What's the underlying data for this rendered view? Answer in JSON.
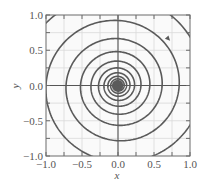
{
  "chart_data": {
    "type": "line",
    "title": "",
    "xlabel": "x",
    "ylabel": "y",
    "xlim": [
      -1.0,
      1.0
    ],
    "ylim": [
      -1.0,
      1.0
    ],
    "xticks": [
      -1.0,
      -0.5,
      0.0,
      0.5,
      1.0
    ],
    "yticks": [
      -1.0,
      -0.5,
      0.0,
      0.5,
      1.0
    ],
    "xtick_labels": [
      "−1.0",
      "−0.5",
      "0.0",
      "0.5",
      "1.0"
    ],
    "ytick_labels": [
      "−1.0",
      "−0.5",
      "0.0",
      "0.5",
      "1.0"
    ],
    "minor_tick_step": 0.25,
    "grid": true,
    "grid_step": 0.25,
    "zero_axes": true,
    "legend": null,
    "series": [
      {
        "name": "phase trajectory (spiral sink)",
        "kind": "logarithmic spiral, clockwise, decaying to origin",
        "start_angle_deg": 150,
        "start_radius": 1.35,
        "decay_per_radian": 0.052,
        "turns": 14,
        "direction": "clockwise",
        "arrow_at": [
          0.7,
          0.66
        ],
        "sample_axis_crossings": {
          "positive_x": [
            0.97,
            0.74,
            0.53,
            0.36,
            0.26,
            0.18,
            0.11,
            0.06
          ],
          "positive_y": [
            0.87,
            0.65,
            0.5,
            0.37,
            0.28,
            0.21
          ],
          "negative_x": [
            -0.85,
            -0.61,
            -0.43,
            -0.31,
            -0.21,
            -0.14
          ],
          "negative_y": [
            -0.91,
            -0.67,
            -0.48,
            -0.34,
            -0.24
          ]
        },
        "color": "#5a5a5a"
      }
    ],
    "colors": {
      "curve": "#5a5a5a",
      "grid": "#d9d9d9",
      "frame": "#6a6a6a",
      "axes_zero": "#555555",
      "text": "#555555"
    }
  }
}
